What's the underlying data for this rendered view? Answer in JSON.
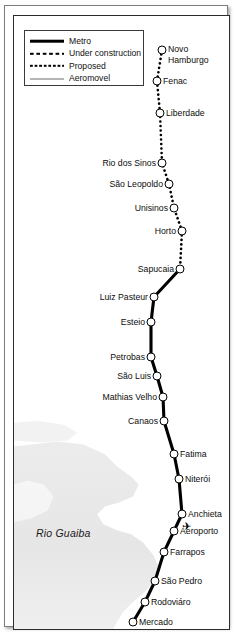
{
  "map": {
    "title": "Porto Alegre Metro / Trensurb line map",
    "river_label": "Rio Guaiba",
    "background_color": "#ffffff",
    "line_color": "#000000",
    "river_color": "#e8e8e8",
    "station_fill": "#ffffff",
    "station_stroke": "#000000"
  },
  "legend": {
    "items": [
      {
        "label": "Metro",
        "style": "solid-thick",
        "icon": "solid-line-icon"
      },
      {
        "label": "Under construction",
        "style": "dashed",
        "icon": "dashed-line-icon"
      },
      {
        "label": "Proposed",
        "style": "dotted",
        "icon": "dotted-line-icon"
      },
      {
        "label": "Aeromovel",
        "style": "solid-thin",
        "icon": "thin-line-icon"
      }
    ]
  },
  "stations": [
    {
      "name": "Novo Hamburgo",
      "label_lines": [
        "Novo",
        "Hamburgo"
      ],
      "side": "right",
      "x": 148,
      "y": 34,
      "segment": "proposed"
    },
    {
      "name": "Fenac",
      "label_lines": [
        "Fenac"
      ],
      "side": "right",
      "x": 143,
      "y": 65,
      "segment": "proposed"
    },
    {
      "name": "Liberdade",
      "label_lines": [
        "Liberdade"
      ],
      "side": "right",
      "x": 146,
      "y": 97,
      "segment": "proposed"
    },
    {
      "name": "Rio dos Sinos",
      "label_lines": [
        "Rio dos Sinos"
      ],
      "side": "left",
      "x": 148,
      "y": 147,
      "segment": "proposed"
    },
    {
      "name": "Sao Leopoldo",
      "label_lines": [
        "São Leopoldo"
      ],
      "side": "left",
      "x": 155,
      "y": 168,
      "segment": "proposed"
    },
    {
      "name": "Unisinos",
      "label_lines": [
        "Unisinos"
      ],
      "side": "left",
      "x": 160,
      "y": 192,
      "segment": "proposed"
    },
    {
      "name": "Horto",
      "label_lines": [
        "Horto"
      ],
      "side": "left",
      "x": 168,
      "y": 215,
      "segment": "proposed"
    },
    {
      "name": "Sapucaia",
      "label_lines": [
        "Sapucaia"
      ],
      "side": "left",
      "x": 166,
      "y": 253,
      "segment": "metro"
    },
    {
      "name": "Luiz Pasteur",
      "label_lines": [
        "Luiz Pasteur"
      ],
      "side": "left",
      "x": 140,
      "y": 281,
      "segment": "metro"
    },
    {
      "name": "Esteio",
      "label_lines": [
        "Esteio"
      ],
      "side": "left",
      "x": 137,
      "y": 306,
      "segment": "metro"
    },
    {
      "name": "Petrobras",
      "label_lines": [
        "Petrobas"
      ],
      "side": "left",
      "x": 137,
      "y": 341,
      "segment": "metro"
    },
    {
      "name": "Sao Luis",
      "label_lines": [
        "São Luis"
      ],
      "side": "left",
      "x": 143,
      "y": 360,
      "segment": "metro"
    },
    {
      "name": "Mathias Velho",
      "label_lines": [
        "Mathias Velho"
      ],
      "side": "left",
      "x": 149,
      "y": 381,
      "segment": "metro"
    },
    {
      "name": "Canaos",
      "label_lines": [
        "Canaos"
      ],
      "side": "left",
      "x": 150,
      "y": 405,
      "segment": "metro"
    },
    {
      "name": "Fatima",
      "label_lines": [
        "Fatima"
      ],
      "side": "right",
      "x": 160,
      "y": 438,
      "segment": "metro"
    },
    {
      "name": "Niteroi",
      "label_lines": [
        "Niterói"
      ],
      "side": "right",
      "x": 165,
      "y": 463,
      "segment": "metro"
    },
    {
      "name": "Anchieta",
      "label_lines": [
        "Anchieta"
      ],
      "side": "right",
      "x": 168,
      "y": 498,
      "segment": "metro"
    },
    {
      "name": "Aeroporto",
      "label_lines": [
        "Aeroporto"
      ],
      "side": "right",
      "x": 160,
      "y": 515,
      "segment": "metro",
      "icon": "airplane-icon"
    },
    {
      "name": "Farrapos",
      "label_lines": [
        "Farrapos"
      ],
      "side": "right",
      "x": 150,
      "y": 536,
      "segment": "metro"
    },
    {
      "name": "Sao Pedro",
      "label_lines": [
        "São Pedro"
      ],
      "side": "right",
      "x": 141,
      "y": 565,
      "segment": "metro"
    },
    {
      "name": "Rodoviaro",
      "label_lines": [
        "Rodoviáro"
      ],
      "side": "right",
      "x": 131,
      "y": 586,
      "segment": "metro"
    },
    {
      "name": "Mercado",
      "label_lines": [
        "Mercado"
      ],
      "side": "right",
      "x": 119,
      "y": 606,
      "segment": "metro"
    }
  ],
  "aeromovel_stub": {
    "x": 124,
    "y": 625,
    "icon": "aeromovel-station-icon"
  }
}
